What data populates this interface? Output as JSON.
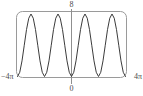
{
  "figure": {
    "kind": "math-graph-thumbnail",
    "frame_color": "#9a9a9a",
    "curve_color": "#3c3c3c",
    "axis_color": "#8f8f8f",
    "background": "#ffffff"
  },
  "labels": {
    "y_max": "8",
    "origin": "0",
    "x_min": "−4π",
    "x_max": "4π"
  },
  "chart_data": {
    "type": "line",
    "title": "",
    "xlabel": "",
    "ylabel": "",
    "xlim": [
      -12.566,
      12.566
    ],
    "ylim": [
      0,
      8
    ],
    "xtick_labels": [
      "−4π",
      "0",
      "4π"
    ],
    "xticks": [
      -12.566,
      0,
      12.566
    ],
    "ytick_labels": [
      "8"
    ],
    "yticks": [
      8
    ],
    "grid": false,
    "legend": false,
    "legend_position": "none",
    "annotations": [
      "4 peaks visible across the window",
      "minimum at x = 0 touches y = 0",
      "peaks reach y ≈ 8"
    ],
    "series": [
      {
        "name": "y = 8 sin^2(x)",
        "x": [
          -12.566,
          -12.042,
          -11.519,
          -10.996,
          -10.472,
          -9.948,
          -9.425,
          -8.901,
          -8.378,
          -7.854,
          -7.33,
          -6.807,
          -6.283,
          -5.76,
          -5.236,
          -4.712,
          -4.189,
          -3.665,
          -3.142,
          -2.618,
          -2.094,
          -1.571,
          -1.047,
          -0.524,
          0.0,
          0.524,
          1.047,
          1.571,
          2.094,
          2.618,
          3.142,
          3.665,
          4.189,
          4.712,
          5.236,
          5.76,
          6.283,
          6.807,
          7.33,
          7.854,
          8.378,
          8.901,
          9.425,
          9.948,
          10.472,
          10.996,
          11.519,
          12.042,
          12.566
        ],
        "y": [
          0.0,
          0.54,
          2.0,
          4.0,
          6.0,
          7.46,
          8.0,
          7.46,
          6.0,
          4.0,
          2.0,
          0.54,
          0.0,
          0.54,
          2.0,
          4.0,
          6.0,
          7.46,
          8.0,
          7.46,
          6.0,
          4.0,
          2.0,
          0.54,
          0.0,
          0.54,
          2.0,
          4.0,
          6.0,
          7.46,
          8.0,
          7.46,
          6.0,
          4.0,
          2.0,
          0.54,
          0.0,
          0.54,
          2.0,
          4.0,
          6.0,
          7.46,
          8.0,
          7.46,
          6.0,
          4.0,
          2.0,
          0.54,
          0.0
        ]
      }
    ]
  }
}
